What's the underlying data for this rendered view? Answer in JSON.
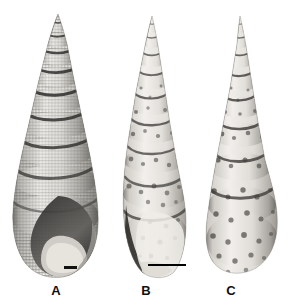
{
  "figure": {
    "kind": "scientific-plate",
    "background_color": "#ffffff",
    "width_px": 296,
    "height_px": 306
  },
  "specimens": [
    {
      "id": "A",
      "label": "A",
      "label_x": 53,
      "label_y": 284,
      "apex_x": 58,
      "apex_y": 14,
      "base_y": 278,
      "max_width": 88,
      "center_x": 55,
      "whorl_count": 11,
      "sculpture": "cancellate, fine spiral and axial ribs",
      "shading": "dark grey bands along sutures, pale whorl faces",
      "tone_light": "#e8e7e4",
      "tone_mid": "#9b9a96",
      "tone_dark": "#3a3937",
      "has_aperture": true,
      "aperture_note": "large ovate aperture at base, shaded dark with pale columellar callus",
      "scale_bar": {
        "present": true,
        "x": 64,
        "y": 266,
        "width": 13,
        "height": 3,
        "color": "#111111"
      }
    },
    {
      "id": "B",
      "label": "B",
      "label_x": 143,
      "label_y": 284,
      "apex_x": 152,
      "apex_y": 16,
      "base_y": 276,
      "max_width": 72,
      "center_x": 150,
      "whorl_count": 11,
      "sculpture": "smooth, spotted / maculated",
      "shading": "pale cream with scattered dark brown blotches in spiral rows",
      "tone_light": "#eceae6",
      "tone_mid": "#a6a29c",
      "tone_dark": "#43413e",
      "has_aperture": true,
      "aperture_note": "elongate aperture at base, dark shadow on left margin",
      "scale_bar": {
        "present": true,
        "x": 148,
        "y": 264,
        "width": 38,
        "height": 2,
        "color": "#000000"
      }
    },
    {
      "id": "C",
      "label": "C",
      "label_x": 228,
      "label_y": 284,
      "apex_x": 240,
      "apex_y": 16,
      "base_y": 272,
      "max_width": 74,
      "center_x": 241,
      "whorl_count": 10,
      "sculpture": "smooth, spotted / maculated",
      "shading": "pale grey with dense dark spiral-arranged spots, swollen body whorl",
      "tone_light": "#e9e7e3",
      "tone_mid": "#a09d98",
      "tone_dark": "#403e3b",
      "has_aperture": false,
      "aperture_note": "abapertural (dorsal) view, no aperture visible",
      "scale_bar": {
        "present": false,
        "x": 0,
        "y": 0,
        "width": 0,
        "height": 0,
        "color": "#000000"
      }
    }
  ]
}
